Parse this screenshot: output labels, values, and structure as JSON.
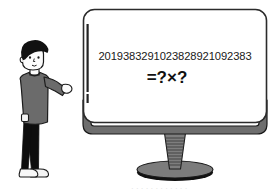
{
  "scene": {
    "title": "Person looking at a monitor showing a large number factorization puzzle",
    "background_color": "#ffffff"
  },
  "monitor": {
    "screen": {
      "number_line": "2019383291023828921092383",
      "equation_line": "=?×?",
      "bezel_color": "#2b2b2b",
      "screen_fill": "#ffffff",
      "side_bar_color": "#222222"
    },
    "frame": {
      "body_color": "#6e6e6e",
      "outline_color": "#1e1e1e"
    },
    "neck": {
      "color": "#7a7a7a",
      "rib_color": "#3a3a3a"
    },
    "base": {
      "top_color": "#7c7c7c",
      "shadow_color": "#111111"
    }
  },
  "person": {
    "hair_color": "#111111",
    "skin_color": "#fbfbfb",
    "skin_outline": "#1a1a1a",
    "sweater_color": "#6b6b6b",
    "sweater_outline": "#1c1c1c",
    "pants_color": "#0d0d0d",
    "shoe_color": "#f4f4f4",
    "shoe_outline": "#1a1a1a",
    "pose": "standing, right arm raised pointing toward the monitor"
  },
  "watermark": {
    "text": "· · · · · ·   · · · · · ·"
  }
}
